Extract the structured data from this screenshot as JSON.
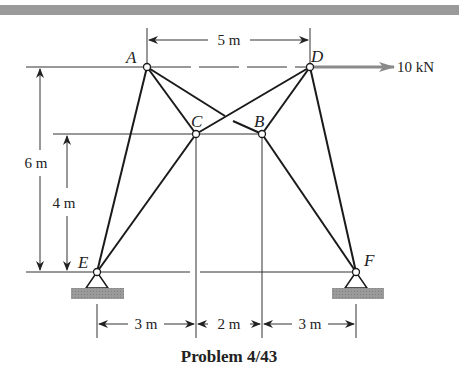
{
  "figure": {
    "title": "Problem 4/43",
    "load": {
      "label": "10 kN",
      "node": "D",
      "direction": "right",
      "color": "#8a8a8a"
    },
    "nodes": [
      {
        "id": "A",
        "label": "A",
        "x": 147,
        "y": 67
      },
      {
        "id": "D",
        "label": "D",
        "x": 310,
        "y": 67
      },
      {
        "id": "C",
        "label": "C",
        "x": 196,
        "y": 134
      },
      {
        "id": "B",
        "label": "B",
        "x": 262,
        "y": 134
      },
      {
        "id": "E",
        "label": "E",
        "x": 97,
        "y": 272
      },
      {
        "id": "F",
        "label": "F",
        "x": 356,
        "y": 272
      }
    ],
    "members": [
      [
        "A",
        "E"
      ],
      [
        "A",
        "C"
      ],
      [
        "A",
        "B"
      ],
      [
        "D",
        "C"
      ],
      [
        "D",
        "B"
      ],
      [
        "D",
        "F"
      ],
      [
        "C",
        "E"
      ],
      [
        "B",
        "F"
      ]
    ],
    "supports": [
      {
        "node": "E",
        "type": "pin"
      },
      {
        "node": "F",
        "type": "pin"
      }
    ],
    "dimensions": {
      "top": "5 m",
      "left_outer": "6 m",
      "left_inner": "4 m",
      "bottom": [
        "3 m",
        "2 m",
        "3 m"
      ]
    }
  }
}
